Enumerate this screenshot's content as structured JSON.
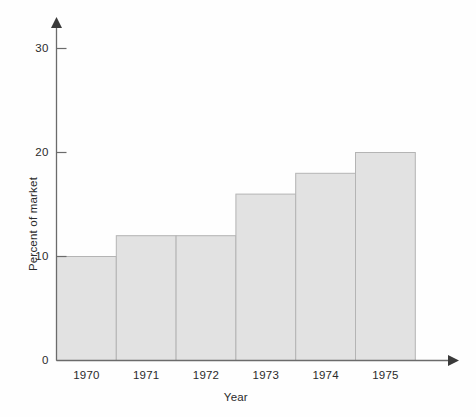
{
  "chart_data": {
    "type": "bar",
    "title": "",
    "subtitle": "",
    "xlabel": "Year",
    "ylabel": "Percent of market",
    "categories": [
      "1970",
      "1971",
      "1972",
      "1973",
      "1974",
      "1975"
    ],
    "values": [
      10,
      12,
      12,
      16,
      18,
      20
    ],
    "series": [
      {
        "name": "Percent of market",
        "values": [
          10,
          12,
          12,
          16,
          18,
          20
        ]
      }
    ],
    "ylim": [
      0,
      32
    ],
    "y_ticks": [
      "0",
      "10",
      "20",
      "30"
    ],
    "y_tick_values": [
      0,
      10,
      20,
      30
    ],
    "x_ticks": [
      "1970",
      "1971",
      "1972",
      "1973",
      "1974",
      "1975"
    ],
    "grid": false,
    "legend": "none",
    "bar_style": "contiguous-histogram",
    "bar_fill_color": "#e2e2e2",
    "bar_edge_color": "#b4b4b4",
    "axis_color": "#6b6b6b",
    "axis_arrows": true,
    "annotations": []
  },
  "axes": {
    "y_axis_name": "Percent of market",
    "x_axis_name": "Year"
  }
}
